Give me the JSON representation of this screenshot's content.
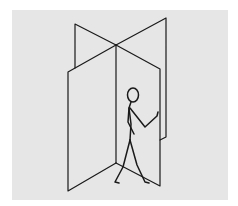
{
  "figure": {
    "colors": {
      "background": "#ffffff",
      "panel_background": "#e6e6e6",
      "line": "#1a1a1a"
    },
    "elements": [
      {
        "name": "back-left-panel"
      },
      {
        "name": "back-right-panel"
      },
      {
        "name": "center-axis"
      },
      {
        "name": "front-left-panel"
      },
      {
        "name": "front-right-panel"
      },
      {
        "name": "stick-figure"
      }
    ]
  }
}
